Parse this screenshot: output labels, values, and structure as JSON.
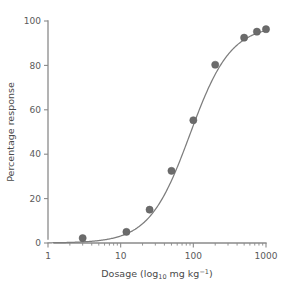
{
  "chart_data": {
    "type": "scatter",
    "title": "",
    "xlabel": "Dosage (log10 mg kg-1)",
    "xlabel_parts": {
      "prefix": "Dosage (log",
      "sub": "10",
      "mid": " mg kg",
      "sup": "−1",
      "suffix": ")"
    },
    "ylabel": "Percentage response",
    "xscale": "log",
    "yscale": "linear",
    "xlim": [
      1,
      1000
    ],
    "ylim": [
      0,
      100
    ],
    "xticks": [
      1,
      10,
      100,
      1000
    ],
    "xtick_labels": [
      "1",
      "10",
      "100",
      "1000"
    ],
    "yticks": [
      0,
      20,
      40,
      60,
      80,
      100
    ],
    "ytick_labels": [
      "0",
      "20",
      "40",
      "60",
      "80",
      "100"
    ],
    "grid": false,
    "legend": null,
    "marker_color": "#6b6b6b",
    "curve_color": "#7d7d7d",
    "axis_color": "#8a8a8a",
    "series": [
      {
        "name": "Observed response",
        "x": [
          3,
          12,
          25,
          50,
          100,
          200,
          500,
          750,
          1000
        ],
        "y": [
          2.2,
          5.0,
          15.0,
          32.5,
          55.3,
          80.3,
          92.5,
          95.2,
          96.3
        ]
      }
    ],
    "fit": {
      "name": "Fitted dose-response curve",
      "model": "logistic",
      "ec50": 90,
      "hill_slope": 1.55,
      "top": 98,
      "bottom": 0
    }
  },
  "figure": {
    "background_color": "#ffffff",
    "width": 281,
    "height": 292
  }
}
